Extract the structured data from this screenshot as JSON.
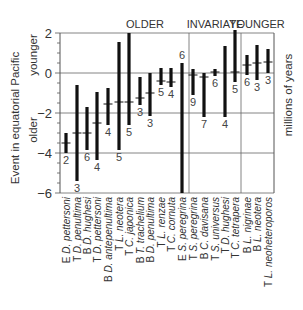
{
  "chart_data": {
    "type": "bar",
    "subtype": "range-bar-with-midpoint",
    "title": "",
    "ylabel": "Event in equatorial Pacific",
    "ylabel_upper": "younger",
    "ylabel_lower": "older",
    "ylabel_right": "millions of years",
    "ylim": [
      -6,
      2
    ],
    "yticks": [
      2,
      0,
      -2,
      -4,
      -6
    ],
    "grid": true,
    "groups": [
      {
        "label": "OLDER",
        "start": 0,
        "end": 11
      },
      {
        "label": "INVARIATE",
        "start": 12,
        "end": 16
      },
      {
        "label": "YOUNGER",
        "start": 17,
        "end": 19
      }
    ],
    "categories": [
      {
        "prefix": "E",
        "genus": "D.",
        "species": "pettersoni"
      },
      {
        "prefix": "T",
        "genus": "D.",
        "species": "penultima"
      },
      {
        "prefix": "B",
        "genus": "D.",
        "species": "hughesi"
      },
      {
        "prefix": "T",
        "genus": "D.",
        "species": "pettersoni"
      },
      {
        "prefix": "B",
        "genus": "D.",
        "species": "antepenultima"
      },
      {
        "prefix": "T",
        "genus": "L.",
        "species": "neotera"
      },
      {
        "prefix": "T",
        "genus": "C.",
        "species": "japonica"
      },
      {
        "prefix": "B",
        "genus": "T.",
        "species": "trachelium"
      },
      {
        "prefix": "B",
        "genus": "D.",
        "species": "penultima"
      },
      {
        "prefix": "T",
        "genus": "L.",
        "species": "renzae"
      },
      {
        "prefix": "T",
        "genus": "C.",
        "species": "cornuta"
      },
      {
        "prefix": "E",
        "genus": "S.",
        "species": "peregrina"
      },
      {
        "prefix": "T",
        "genus": "S.",
        "species": "peregrina"
      },
      {
        "prefix": "B",
        "genus": "C.",
        "species": "davisana"
      },
      {
        "prefix": "T",
        "genus": "S.",
        "species": "universus"
      },
      {
        "prefix": "T",
        "genus": "D.",
        "species": "hughesi"
      },
      {
        "prefix": "T",
        "genus": "C.",
        "species": "tetrapera"
      },
      {
        "prefix": "B",
        "genus": "L.",
        "species": "nigrinae"
      },
      {
        "prefix": "B",
        "genus": "L.",
        "species": "neotera"
      },
      {
        "prefix": "T",
        "genus": "L.",
        "species": "neoheteroporos"
      }
    ],
    "series": [
      {
        "name": "max",
        "values": [
          -3.0,
          -0.6,
          -1.7,
          -0.95,
          -0.75,
          1.55,
          2.0,
          -0.2,
          0.0,
          0.25,
          0.25,
          0.5,
          0.2,
          0.0,
          0.2,
          1.35,
          2.15,
          0.9,
          1.4,
          1.2
        ]
      },
      {
        "name": "min",
        "values": [
          -4.0,
          -5.4,
          -3.85,
          -4.35,
          -2.6,
          -3.85,
          -2.6,
          -1.6,
          -2.15,
          -0.6,
          -0.7,
          -6.0,
          -1.1,
          -2.2,
          -0.15,
          -2.2,
          -0.45,
          -0.1,
          -0.35,
          0.0
        ]
      },
      {
        "name": "mean",
        "values": [
          -3.5,
          -3.0,
          -3.0,
          -2.5,
          -1.55,
          -1.45,
          -1.45,
          -1.25,
          -1.0,
          -0.4,
          -0.45,
          null,
          -0.1,
          -0.2,
          0.05,
          null,
          0.05,
          0.4,
          0.5,
          0.55
        ]
      },
      {
        "name": "n",
        "values": [
          2,
          3,
          6,
          4,
          4,
          5,
          5,
          3,
          3,
          5,
          4,
          6,
          9,
          7,
          6,
          4,
          5,
          6,
          3,
          3
        ]
      }
    ],
    "n_label_position": [
      "below",
      "below",
      "below",
      "below",
      "below",
      "below",
      "below",
      "below",
      "below",
      "below",
      "below",
      "above",
      "below",
      "below",
      "below",
      "below",
      "below",
      "below",
      "below",
      "below"
    ]
  },
  "colors": {
    "bar": "#111111",
    "frame": "#555555",
    "grid": "#666666",
    "text": "#333333"
  }
}
